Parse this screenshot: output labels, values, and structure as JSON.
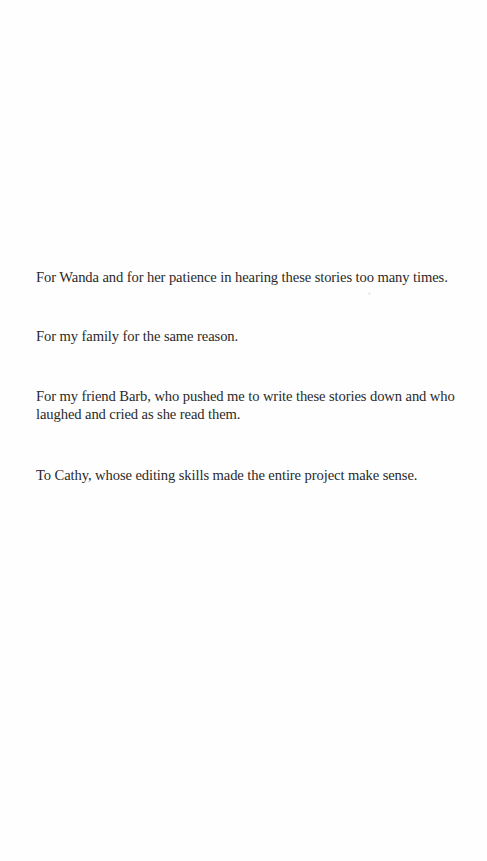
{
  "dedication": {
    "paragraphs": [
      "For Wanda and for her patience in hearing these stories too many times.",
      "For my family for the same reason.",
      "For my friend Barb, who pushed me to write these stories down and who laughed and cried as she read them.",
      "To Cathy, whose editing skills made the entire project make sense."
    ]
  }
}
